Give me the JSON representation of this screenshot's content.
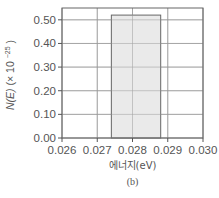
{
  "chart_data": {
    "type": "bar",
    "title": "",
    "xlabel": "에너지(eV)",
    "ylabel": "N(E) (× 10^-25)",
    "ylabel_main": "N(E)",
    "ylabel_scale": "(× 10",
    "ylabel_exp": "−25",
    "ylabel_close": ")",
    "caption": "(b)",
    "xlim": [
      0.026,
      0.03
    ],
    "ylim": [
      0.0,
      0.55
    ],
    "xticks": [
      "0.026",
      "0.027",
      "0.028",
      "0.029",
      "0.030"
    ],
    "yticks": [
      "0.00",
      "0.10",
      "0.20",
      "0.30",
      "0.40",
      "0.50"
    ],
    "grid": true,
    "bars": [
      {
        "x_start": 0.0274,
        "x_end": 0.0288,
        "value": 0.52
      }
    ],
    "colors": {
      "bar_fill": "#e6e6e6",
      "bar_edge": "#666666",
      "grid": "#999999",
      "axis": "#555555"
    }
  }
}
